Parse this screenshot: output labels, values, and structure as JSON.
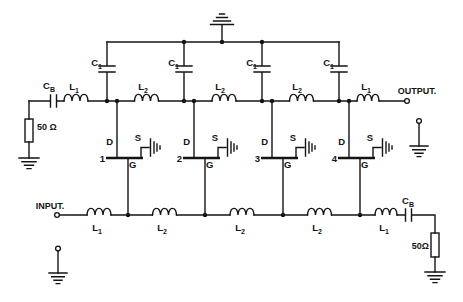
{
  "colors": {
    "ink": "#141414",
    "background": "#ffffff"
  },
  "terminals": {
    "input": "INPUT.",
    "output": "OUTPUT."
  },
  "components": {
    "coupling_cap": {
      "letter": "C",
      "sub": "B"
    },
    "bias_cap": {
      "letter": "C",
      "sub": "1"
    },
    "end_inductor": {
      "letter": "L",
      "sub": "1"
    },
    "line_inductor": {
      "letter": "L",
      "sub": "2"
    },
    "input_resistor": "50 Ω",
    "output_resistor": "50Ω"
  },
  "fets": [
    {
      "number": "1",
      "drain": "D",
      "source": "S",
      "gate": "G"
    },
    {
      "number": "2",
      "drain": "D",
      "source": "S",
      "gate": "G"
    },
    {
      "number": "3",
      "drain": "D",
      "source": "S",
      "gate": "G"
    },
    {
      "number": "4",
      "drain": "D",
      "source": "S",
      "gate": "G"
    }
  ]
}
